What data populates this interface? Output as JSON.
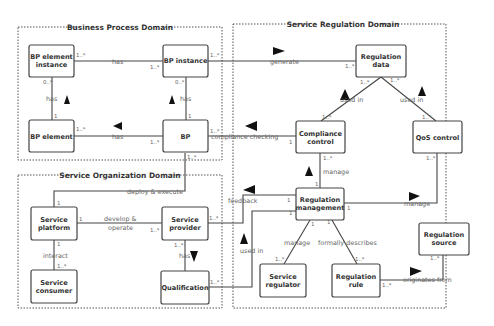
{
  "domains": [
    {
      "id": "bpd",
      "title": "Business Process Domain"
    },
    {
      "id": "sod",
      "title": "Service Organization Domain"
    },
    {
      "id": "srd",
      "title": "Service Regulation Domain"
    }
  ],
  "entities": {
    "bp_element_instance": [
      "BP element",
      "instance"
    ],
    "bp_instance": [
      "BP instance"
    ],
    "bp_element": [
      "BP element"
    ],
    "bp": [
      "BP"
    ],
    "service_platform": [
      "Service",
      "platform"
    ],
    "service_provider": [
      "Service",
      "provider"
    ],
    "service_consumer": [
      "Service",
      "consumer"
    ],
    "qualification": [
      "Qualification"
    ],
    "regulation_data": [
      "Regulation",
      "data"
    ],
    "compliance_control": [
      "Compliance",
      "control"
    ],
    "qos_control": [
      "QoS control"
    ],
    "regulation_management": [
      "Regulation",
      "management"
    ],
    "service_regulator": [
      "Service",
      "regulator"
    ],
    "regulation_rule": [
      "Regulation",
      "rule"
    ],
    "regulation_source": [
      "Regulation",
      "source"
    ]
  },
  "relations": {
    "bpei_has_bpi": "has",
    "bpe_has_bpei": "has",
    "bp_has_bpi": "has",
    "bp_has_bpe": "has",
    "bpi_generate": "generate",
    "bp_compliance": "compliance checking",
    "bp_deploy": "deploy & execute",
    "develop1": "develop &",
    "develop2": "operate",
    "interact": "interact",
    "provider_has": "has",
    "used_in_left": "used in",
    "used_in_right": "used in",
    "manage_cc": "manage",
    "feedback": "feedback",
    "used_in_qual": "used in",
    "manage_qos": "manage",
    "manage_reg": "manage",
    "formally": "formally describes",
    "originates": "originates from"
  },
  "multiplicities": {
    "one_many": "1..*",
    "zero_many": "0..*",
    "one": "1"
  }
}
